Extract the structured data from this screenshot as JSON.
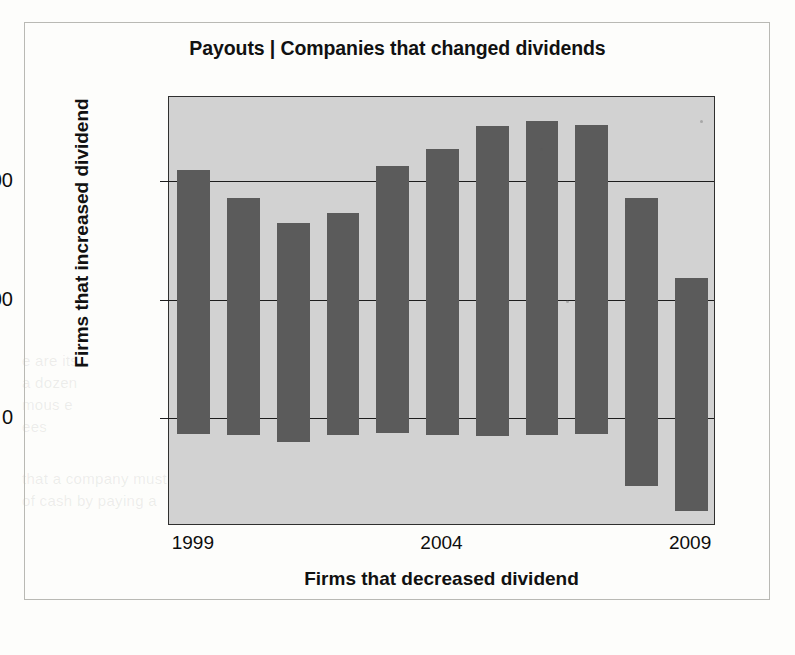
{
  "figure": {
    "title": "Payouts | Companies that changed dividends",
    "x_axis_title": "Firms that decreased dividend",
    "y_axis_title": "Firms that increased dividend",
    "plot_background_color": "#d2d2d2",
    "bar_color": "#5b5b5b",
    "axis_color": "#1d1d1d"
  },
  "ghost_text": [
    {
      "text": "e are its",
      "left": 22,
      "top": 352
    },
    {
      "text": "a dozen",
      "left": 22,
      "top": 374
    },
    {
      "text": "mous e",
      "left": 22,
      "top": 396
    },
    {
      "text": "ees",
      "left": 22,
      "top": 418
    },
    {
      "text": "that a company must",
      "left": 22,
      "top": 470
    },
    {
      "text": "of cash by paying a",
      "left": 22,
      "top": 492
    }
  ],
  "chart_data": {
    "type": "bar",
    "title": "Payouts | Companies that changed dividends",
    "xlabel": "Firms that decreased dividend",
    "ylabel": "Firms that increased dividend",
    "categories": [
      "1999",
      "2000",
      "2001",
      "2002",
      "2003",
      "2004",
      "2005",
      "2006",
      "2007",
      "2008",
      "2009"
    ],
    "tick_labels": [
      "1999",
      "2004",
      "2009"
    ],
    "tick_label_categories": [
      "1999",
      "2004",
      "2009"
    ],
    "ytick_labels": [
      "2,000",
      "1,000",
      "0"
    ],
    "ytick_values": [
      2000,
      1000,
      0
    ],
    "ylim": [
      -910,
      2710
    ],
    "grid": true,
    "grid_axis": "y",
    "legend": false,
    "series": [
      {
        "name": "Firms that increased dividend",
        "values": [
          2095,
          1860,
          1650,
          1735,
          2130,
          2270,
          2465,
          2510,
          2470,
          1855,
          1185
        ]
      },
      {
        "name": "Firms that decreased dividend",
        "values": [
          -130,
          -140,
          -205,
          -140,
          -125,
          -140,
          -150,
          -145,
          -130,
          -575,
          -785
        ]
      }
    ]
  }
}
